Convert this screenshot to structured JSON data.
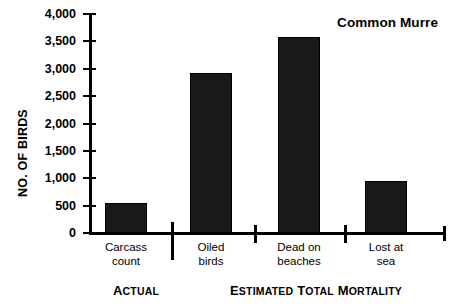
{
  "chart_data": {
    "type": "bar",
    "title": "Common Murre",
    "xlabel": "",
    "ylabel": "NO. OF BIRDS",
    "categories": [
      "Carcass\ncount",
      "Oiled\nbirds",
      "Dead on\nbeaches",
      "Lost at\nsea"
    ],
    "values": [
      550,
      2920,
      3580,
      950
    ],
    "ylim": [
      0,
      4000
    ],
    "yticks": [
      0,
      500,
      1000,
      1500,
      2000,
      2500,
      3000,
      3500,
      4000
    ],
    "ytick_labels": [
      "0",
      "500",
      "1,000",
      "1,500",
      "2,000",
      "2,500",
      "3,000",
      "3,500",
      "4,000"
    ],
    "grid": false,
    "legend": "none",
    "bar_color": "#191919",
    "groups": [
      {
        "label_main": "A",
        "label_rest": "CTUAL",
        "categories": [
          "Carcass count"
        ]
      },
      {
        "label_main": "E",
        "label_rest": "STIMATED ",
        "label_main2": "T",
        "label_rest2": "OTAL ",
        "label_main3": "M",
        "label_rest3": "ORTALITY",
        "categories": [
          "Oiled birds",
          "Dead on beaches",
          "Lost at sea"
        ]
      }
    ]
  },
  "axis": {
    "y_title": "NO. OF BIRDS"
  },
  "group_labels": {
    "actual": "ACTUAL",
    "estimated": "ESTIMATED TOTAL MORTALITY"
  }
}
